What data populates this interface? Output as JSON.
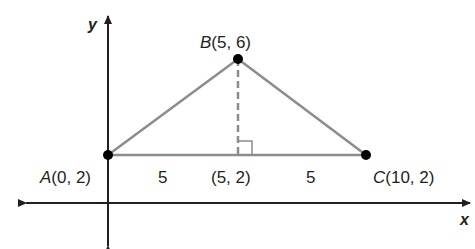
{
  "diagram": {
    "type": "coordinate-geometry",
    "axes": {
      "x_label": "x",
      "y_label": "y"
    },
    "points": [
      {
        "name": "A",
        "x": 0,
        "y": 2,
        "coords_text": "(0, 2)"
      },
      {
        "name": "B",
        "x": 5,
        "y": 6,
        "coords_text": "(5, 6)"
      },
      {
        "name": "C",
        "x": 10,
        "y": 2,
        "coords_text": "(10, 2)"
      }
    ],
    "foot": {
      "x": 5,
      "y": 2,
      "coords_text": "(5, 2)"
    },
    "segment_labels": {
      "left": "5",
      "right": "5"
    },
    "colors": {
      "axis": "#231f20",
      "triangle": "#8c8c8c",
      "altitude": "#8c8c8c",
      "point": "#000000"
    }
  }
}
